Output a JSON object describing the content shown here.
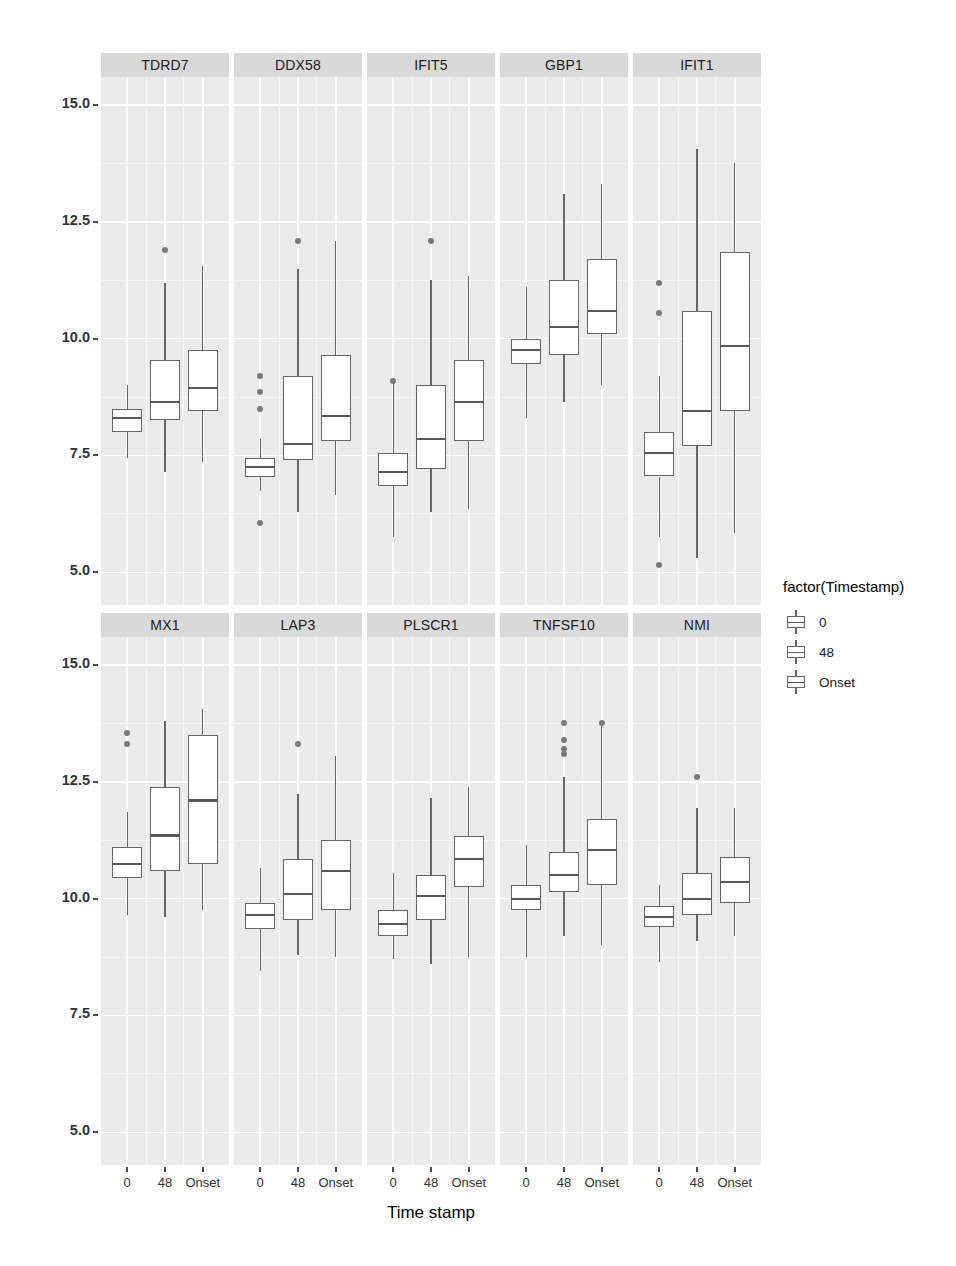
{
  "chart_data": {
    "type": "box",
    "title": "",
    "xlabel": "Time stamp",
    "ylabel": "Log2 Normalized Expression Values",
    "ylim": [
      4.3,
      15.6
    ],
    "yticks": [
      5.0,
      7.5,
      10.0,
      12.5,
      15.0
    ],
    "ytick_labels": [
      "5.0",
      "7.5",
      "10.0",
      "12.5",
      "15.0"
    ],
    "categories": [
      "0",
      "48",
      "Onset"
    ],
    "grid": true,
    "legend": {
      "title": "factor(Timestamp)",
      "position": "right",
      "entries": [
        "0",
        "48",
        "Onset"
      ]
    },
    "facets": [
      {
        "name": "TDRD7",
        "row": 0,
        "col": 0,
        "boxes": [
          {
            "group": "0",
            "min": 7.45,
            "q1": 8.0,
            "median": 8.3,
            "q3": 8.5,
            "max": 9.0,
            "outliers": []
          },
          {
            "group": "48",
            "min": 7.15,
            "q1": 8.25,
            "median": 8.65,
            "q3": 9.55,
            "max": 11.2,
            "outliers": [
              11.9
            ]
          },
          {
            "group": "Onset",
            "min": 7.35,
            "q1": 8.45,
            "median": 8.95,
            "q3": 9.75,
            "max": 11.55,
            "outliers": []
          }
        ]
      },
      {
        "name": "DDX58",
        "row": 0,
        "col": 1,
        "boxes": [
          {
            "group": "0",
            "min": 6.75,
            "q1": 7.05,
            "median": 7.25,
            "q3": 7.45,
            "max": 7.85,
            "outliers": [
              9.2,
              8.85,
              8.5,
              6.05
            ]
          },
          {
            "group": "48",
            "min": 6.3,
            "q1": 7.4,
            "median": 7.75,
            "q3": 9.2,
            "max": 11.5,
            "outliers": [
              12.1
            ]
          },
          {
            "group": "Onset",
            "min": 6.65,
            "q1": 7.8,
            "median": 8.35,
            "q3": 9.65,
            "max": 12.1,
            "outliers": []
          }
        ]
      },
      {
        "name": "IFIT5",
        "row": 0,
        "col": 2,
        "boxes": [
          {
            "group": "0",
            "min": 5.75,
            "q1": 6.85,
            "median": 7.15,
            "q3": 7.55,
            "max": 9.1,
            "outliers": [
              9.1
            ]
          },
          {
            "group": "48",
            "min": 6.3,
            "q1": 7.2,
            "median": 7.85,
            "q3": 9.0,
            "max": 11.25,
            "outliers": [
              12.1
            ]
          },
          {
            "group": "Onset",
            "min": 6.35,
            "q1": 7.8,
            "median": 8.65,
            "q3": 9.55,
            "max": 11.35,
            "outliers": []
          }
        ]
      },
      {
        "name": "GBP1",
        "row": 0,
        "col": 3,
        "boxes": [
          {
            "group": "0",
            "min": 8.3,
            "q1": 9.45,
            "median": 9.75,
            "q3": 10.0,
            "max": 11.1,
            "outliers": []
          },
          {
            "group": "48",
            "min": 8.65,
            "q1": 9.65,
            "median": 10.25,
            "q3": 11.25,
            "max": 13.1,
            "outliers": []
          },
          {
            "group": "Onset",
            "min": 9.0,
            "q1": 10.1,
            "median": 10.6,
            "q3": 11.7,
            "max": 13.3,
            "outliers": []
          }
        ]
      },
      {
        "name": "IFIT1",
        "row": 0,
        "col": 4,
        "boxes": [
          {
            "group": "0",
            "min": 5.75,
            "q1": 7.05,
            "median": 7.55,
            "q3": 8.0,
            "max": 9.2,
            "outliers": [
              11.2,
              10.55,
              5.15
            ]
          },
          {
            "group": "48",
            "min": 5.3,
            "q1": 7.7,
            "median": 8.45,
            "q3": 10.6,
            "max": 14.05,
            "outliers": []
          },
          {
            "group": "Onset",
            "min": 5.85,
            "q1": 8.45,
            "median": 9.85,
            "q3": 11.85,
            "max": 13.75,
            "outliers": []
          }
        ]
      },
      {
        "name": "MX1",
        "row": 1,
        "col": 0,
        "boxes": [
          {
            "group": "0",
            "min": 9.65,
            "q1": 10.45,
            "median": 10.75,
            "q3": 11.1,
            "max": 11.85,
            "outliers": [
              13.55,
              13.3
            ]
          },
          {
            "group": "48",
            "min": 9.6,
            "q1": 10.6,
            "median": 11.35,
            "q3": 12.4,
            "max": 13.8,
            "outliers": []
          },
          {
            "group": "Onset",
            "min": 9.75,
            "q1": 10.75,
            "median": 12.1,
            "q3": 13.5,
            "max": 14.05,
            "outliers": []
          }
        ]
      },
      {
        "name": "LAP3",
        "row": 1,
        "col": 1,
        "boxes": [
          {
            "group": "0",
            "min": 8.45,
            "q1": 9.35,
            "median": 9.65,
            "q3": 9.9,
            "max": 10.65,
            "outliers": []
          },
          {
            "group": "48",
            "min": 8.8,
            "q1": 9.55,
            "median": 10.1,
            "q3": 10.85,
            "max": 12.25,
            "outliers": [
              13.3
            ]
          },
          {
            "group": "Onset",
            "min": 8.75,
            "q1": 9.75,
            "median": 10.6,
            "q3": 11.25,
            "max": 13.05,
            "outliers": []
          }
        ]
      },
      {
        "name": "PLSCR1",
        "row": 1,
        "col": 2,
        "boxes": [
          {
            "group": "0",
            "min": 8.7,
            "q1": 9.2,
            "median": 9.45,
            "q3": 9.75,
            "max": 10.55,
            "outliers": []
          },
          {
            "group": "48",
            "min": 8.6,
            "q1": 9.55,
            "median": 10.05,
            "q3": 10.5,
            "max": 12.15,
            "outliers": []
          },
          {
            "group": "Onset",
            "min": 8.75,
            "q1": 10.25,
            "median": 10.85,
            "q3": 11.35,
            "max": 12.4,
            "outliers": []
          }
        ]
      },
      {
        "name": "TNFSF10",
        "row": 1,
        "col": 3,
        "boxes": [
          {
            "group": "0",
            "min": 8.75,
            "q1": 9.75,
            "median": 10.0,
            "q3": 10.3,
            "max": 11.15,
            "outliers": []
          },
          {
            "group": "48",
            "min": 9.2,
            "q1": 10.15,
            "median": 10.5,
            "q3": 11.0,
            "max": 12.6,
            "outliers": [
              13.75,
              13.4,
              13.2,
              13.1
            ]
          },
          {
            "group": "Onset",
            "min": 9.0,
            "q1": 10.3,
            "median": 11.05,
            "q3": 11.7,
            "max": 13.75,
            "outliers": [
              13.75
            ]
          }
        ]
      },
      {
        "name": "NMI",
        "row": 1,
        "col": 4,
        "boxes": [
          {
            "group": "0",
            "min": 8.65,
            "q1": 9.4,
            "median": 9.6,
            "q3": 9.85,
            "max": 10.3,
            "outliers": []
          },
          {
            "group": "48",
            "min": 9.1,
            "q1": 9.65,
            "median": 10.0,
            "q3": 10.55,
            "max": 11.95,
            "outliers": [
              12.6
            ]
          },
          {
            "group": "Onset",
            "min": 9.2,
            "q1": 9.9,
            "median": 10.35,
            "q3": 10.9,
            "max": 11.95,
            "outliers": []
          }
        ]
      }
    ]
  }
}
